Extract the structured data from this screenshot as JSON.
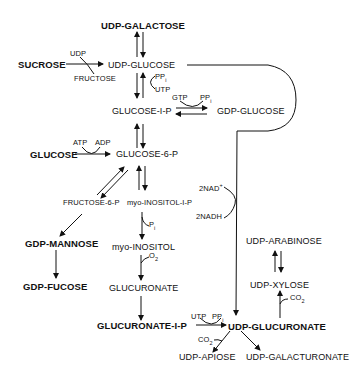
{
  "diagram": {
    "type": "metabolic-pathway",
    "nodes": {
      "udp_galactose": "UDP-GALACTOSE",
      "sucrose": "SUCROSE",
      "udp_glucose": "UDP-GLUCOSE",
      "glucose_1_p": "GLUCOSE-I-P",
      "gdp_glucose": "GDP-GLUCOSE",
      "glucose": "GLUCOSE",
      "glucose_6_p": "GLUCOSE-6-P",
      "fructose_6_p": "FRUCTOSE-6-P",
      "myo_inositol_1_p": "myo-INOSITOL-I-P",
      "gdp_mannose": "GDP-MANNOSE",
      "myo_inositol": "myo-INOSITOL",
      "gdp_fucose": "GDP-FUCOSE",
      "glucuronate": "GLUCURONATE",
      "glucuronate_1_p": "GLUCURONATE-I-P",
      "udp_arabinose": "UDP-ARABINOSE",
      "udp_xylose": "UDP-XYLOSE",
      "udp_glucuronate": "UDP-GLUCURONATE",
      "udp_apiose": "UDP-APIOSE",
      "udp_galacturonate": "UDP-GALACTURONATE"
    },
    "cofactors": {
      "udp": "UDP",
      "fructose": "FRUCTOSE",
      "ppi_1": "PP",
      "utp_1": "UTP",
      "gtp": "GTP",
      "ppi_2": "PP",
      "atp": "ATP",
      "adp": "ADP",
      "nad": "2NAD",
      "nad_sup": "+",
      "nadh": "2NADH",
      "pi": "P",
      "o2": "O",
      "o2_sub": "2",
      "co2_xylose": "CO",
      "co2_apiose": "CO",
      "utp_2": "UTP",
      "ppi_3": "PP",
      "i_sub": "i",
      "two_sub": "2"
    }
  }
}
